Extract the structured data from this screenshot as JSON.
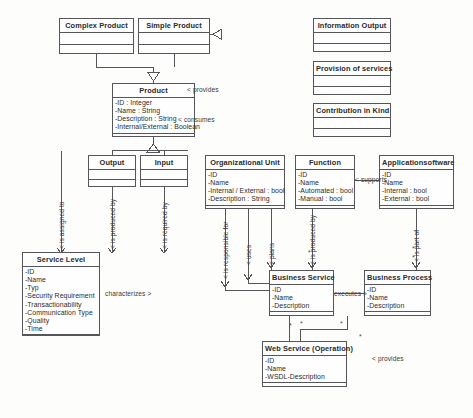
{
  "diagram": {
    "type": "uml-class-diagram",
    "background": "#fdfdfc",
    "line_color": "#56565a"
  },
  "classes": [
    {
      "id": "complex-product",
      "name": "Complex Product",
      "attributes": [],
      "operations": [],
      "x": 59,
      "y": 18,
      "w": 75,
      "h": 36
    },
    {
      "id": "simple-product",
      "name": "Simple Product",
      "attributes": [],
      "operations": [],
      "x": 138,
      "y": 18,
      "w": 72,
      "h": 36
    },
    {
      "id": "information-output",
      "name": "Information Output",
      "attributes": [],
      "operations": [],
      "x": 313,
      "y": 18,
      "w": 78,
      "h": 34
    },
    {
      "id": "provision-of-services",
      "name": "Provision of services",
      "attributes": [],
      "operations": [],
      "x": 313,
      "y": 61,
      "w": 78,
      "h": 34
    },
    {
      "id": "contribution-in-kind",
      "name": "Contribution in Kind",
      "attributes": [],
      "operations": [],
      "x": 313,
      "y": 103,
      "w": 78,
      "h": 34
    },
    {
      "id": "product",
      "name": "Product",
      "attributes": [
        "-ID : Integer",
        "-Name : String",
        "-Description : String",
        "-Internal/External : Boolean"
      ],
      "operations": [],
      "x": 112,
      "y": 83,
      "w": 83,
      "h": 54
    },
    {
      "id": "output",
      "name": "Output",
      "attributes": [],
      "operations": [],
      "x": 88,
      "y": 155,
      "w": 48,
      "h": 32
    },
    {
      "id": "input",
      "name": "Input",
      "attributes": [],
      "operations": [],
      "x": 140,
      "y": 155,
      "w": 48,
      "h": 32
    },
    {
      "id": "organizational-unit",
      "name": "Organizational Unit",
      "attributes": [
        "-ID",
        "-Name",
        "-Internal / External : bool",
        "-Description : String"
      ],
      "operations": [],
      "x": 205,
      "y": 155,
      "w": 80,
      "h": 54
    },
    {
      "id": "function",
      "name": "Function",
      "attributes": [
        "-ID",
        "-Name",
        "-Automated : bool",
        "-Manual : bool"
      ],
      "operations": [],
      "x": 295,
      "y": 155,
      "w": 60,
      "h": 54
    },
    {
      "id": "applicationsoftware",
      "name": "Applicationsoftware",
      "attributes": [
        "-ID",
        "-Name",
        "-Internal : bool",
        "-External : bool"
      ],
      "operations": [],
      "x": 379,
      "y": 155,
      "w": 75,
      "h": 54
    },
    {
      "id": "service-level",
      "name": "Service Level",
      "attributes": [
        "-ID",
        "-Name",
        "-Typ",
        "-Security Requirement",
        "-Transactionability",
        "-Communication Type",
        "-Quality",
        "-Time"
      ],
      "operations": [],
      "x": 22,
      "y": 252,
      "w": 78,
      "h": 84
    },
    {
      "id": "business-service",
      "name": "Business Service",
      "attributes": [
        "-ID",
        "-Name",
        "-Description"
      ],
      "operations": [],
      "x": 269,
      "y": 270,
      "w": 65,
      "h": 46
    },
    {
      "id": "business-process",
      "name": "Business Process",
      "attributes": [
        "-ID",
        "-Name",
        "-Description"
      ],
      "operations": [],
      "x": 364,
      "y": 270,
      "w": 67,
      "h": 46
    },
    {
      "id": "web-service-operation",
      "name": "Web Service (Operation)",
      "attributes": [
        "-ID",
        "-Name",
        "-WSDL-Description"
      ],
      "operations": [],
      "x": 262,
      "y": 341,
      "w": 85,
      "h": 46
    }
  ],
  "labels": [
    {
      "id": "provides-top",
      "text": "< provides",
      "x": 187,
      "y": 86,
      "orientation": "horizontal"
    },
    {
      "id": "consumes",
      "text": "< consumes",
      "x": 178,
      "y": 116,
      "orientation": "horizontal"
    },
    {
      "id": "supports",
      "text": "< supports",
      "x": 355,
      "y": 176,
      "orientation": "horizontal"
    },
    {
      "id": "characterizes",
      "text": "characterizes >",
      "x": 105,
      "y": 290,
      "orientation": "horizontal"
    },
    {
      "id": "executes",
      "text": "executes >",
      "x": 334,
      "y": 290,
      "orientation": "horizontal"
    },
    {
      "id": "provides-bottom",
      "text": "< provides",
      "x": 372,
      "y": 355,
      "orientation": "horizontal"
    },
    {
      "id": "is-assigned-to",
      "text": "< is assigned to",
      "x": 61,
      "y": 249,
      "orientation": "vertical"
    },
    {
      "id": "is-produced-by-output",
      "text": "< is produced by",
      "x": 112,
      "y": 249,
      "orientation": "vertical"
    },
    {
      "id": "is-required-by",
      "text": "< is required by",
      "x": 164,
      "y": 249,
      "orientation": "vertical"
    },
    {
      "id": "is-responsible-for",
      "text": "< is responsible for",
      "x": 225,
      "y": 275,
      "orientation": "vertical"
    },
    {
      "id": "uses",
      "text": "< uses",
      "x": 248,
      "y": 263,
      "orientation": "vertical"
    },
    {
      "id": "plans",
      "text": "< plans",
      "x": 271,
      "y": 263,
      "orientation": "vertical"
    },
    {
      "id": "is-produced-by-bs",
      "text": "< is produced by",
      "x": 312,
      "y": 265,
      "orientation": "vertical"
    },
    {
      "id": "is-part-of",
      "text": "< is part of",
      "x": 416,
      "y": 262,
      "orientation": "vertical"
    }
  ],
  "multiplicities": [
    {
      "id": "mult-bs-top",
      "text": "*",
      "x": 308,
      "y": 249
    },
    {
      "id": "mult-bp-top1",
      "text": "*",
      "x": 412,
      "y": 247
    },
    {
      "id": "mult-bp-top2",
      "text": "*",
      "x": 412,
      "y": 255
    },
    {
      "id": "mult-bs-b1",
      "text": "*",
      "x": 289,
      "y": 323
    },
    {
      "id": "mult-bs-b2",
      "text": "*",
      "x": 300,
      "y": 321
    },
    {
      "id": "mult-bs-b3",
      "text": "*",
      "x": 340,
      "y": 321
    },
    {
      "id": "mult-ws-r",
      "text": "*",
      "x": 359,
      "y": 334
    }
  ],
  "relationships": [
    {
      "id": "rel-complex-product-generalization",
      "kind": "generalization",
      "from": "complex-product",
      "to": "product"
    },
    {
      "id": "rel-simple-product-generalization",
      "kind": "generalization",
      "from": "simple-product",
      "to": "product"
    },
    {
      "id": "rel-product-output-input",
      "kind": "generalization",
      "from": "product",
      "to": "output"
    },
    {
      "id": "rel-output-service-level",
      "kind": "association",
      "from": "output",
      "to": "service-level"
    },
    {
      "id": "rel-orgunit-business-service",
      "kind": "association",
      "from": "organizational-unit",
      "to": "business-service"
    },
    {
      "id": "rel-function-business-service",
      "kind": "association",
      "from": "function",
      "to": "business-service"
    },
    {
      "id": "rel-appsoftware-business-process",
      "kind": "association",
      "from": "applicationsoftware",
      "to": "business-process"
    },
    {
      "id": "rel-bs-executes-bp",
      "kind": "association",
      "from": "business-service",
      "to": "business-process"
    },
    {
      "id": "rel-bs-webservice",
      "kind": "association",
      "from": "business-service",
      "to": "web-service-operation"
    },
    {
      "id": "rel-function-appsoftware-supports",
      "kind": "association",
      "from": "applicationsoftware",
      "to": "function"
    }
  ]
}
